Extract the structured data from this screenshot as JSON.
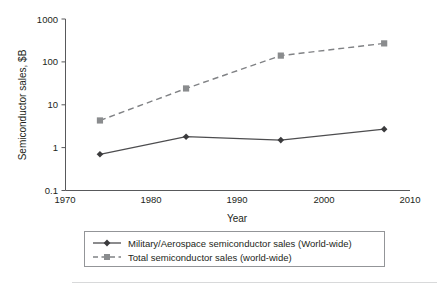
{
  "chart_data": {
    "type": "line",
    "title": "",
    "subtitle": "",
    "xlabel": "Year",
    "ylabel": "Semiconductor sales, $B",
    "xlim": [
      1970,
      2010
    ],
    "ylim": [
      0.1,
      1000
    ],
    "yscale": "log",
    "xscale": "linear",
    "grid": false,
    "legend_position": "bottom",
    "xticks": [
      "1970",
      "1980",
      "1990",
      "2000",
      "2010"
    ],
    "xtick_values": [
      1970,
      1980,
      1990,
      2000,
      2010
    ],
    "yticks": [
      "0.1",
      "1",
      "10",
      "100",
      "1000"
    ],
    "ytick_values": [
      0.1,
      1,
      10,
      100,
      1000
    ],
    "x": [
      1974,
      1984,
      1995,
      2007
    ],
    "series": [
      {
        "name": "Military/Aerospace semiconductor sales (World-wide)",
        "values": [
          0.7,
          1.8,
          1.5,
          2.7
        ],
        "linestyle": "solid",
        "marker": "diamond",
        "color": "#4d4d4f"
      },
      {
        "name": "Total semiconductor sales (world-wide)",
        "values": [
          4.3,
          24,
          140,
          270
        ],
        "linestyle": "dashed",
        "marker": "square",
        "color": "#808285"
      }
    ]
  },
  "legend": {
    "entries": [
      {
        "label": "Military/Aerospace semiconductor sales (World-wide)"
      },
      {
        "label": "Total semiconductor sales (world-wide)"
      }
    ]
  },
  "axes": {
    "y_title": "Semiconductor sales, $B",
    "x_title": "Year"
  },
  "colors": {
    "military": "#4d4d4f",
    "total": "#808285",
    "axis": "#58595b",
    "text": "#231f20",
    "legend_border": "#939598",
    "background": "#ffffff"
  }
}
